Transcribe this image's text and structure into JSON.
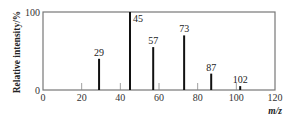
{
  "chart_data": {
    "type": "bar",
    "title": "",
    "xlabel": "m/z",
    "ylabel": "Relative intensity/%",
    "xlim": [
      0,
      120
    ],
    "ylim": [
      0,
      100
    ],
    "x_ticks": [
      0,
      20,
      40,
      60,
      80,
      100,
      120
    ],
    "y_ticks": [
      0,
      100
    ],
    "grid": false,
    "legend": null,
    "peaks": [
      {
        "mz": 29,
        "intensity": 40,
        "label": "29"
      },
      {
        "mz": 45,
        "intensity": 100,
        "label": "45"
      },
      {
        "mz": 57,
        "intensity": 55,
        "label": "57"
      },
      {
        "mz": 73,
        "intensity": 70,
        "label": "73"
      },
      {
        "mz": 87,
        "intensity": 21,
        "label": "87"
      },
      {
        "mz": 102,
        "intensity": 5,
        "label": "102"
      }
    ],
    "categories": [
      "29",
      "45",
      "57",
      "73",
      "87",
      "102"
    ],
    "values": [
      40,
      100,
      57,
      70,
      21,
      5
    ]
  },
  "labels": {
    "ylabel": "Relative intensity/%",
    "xlabel": "m/z",
    "y_top": "100",
    "y_bottom": "0"
  },
  "colors": {
    "frame": "#777777",
    "peak": "#111111",
    "tick": "#888888"
  }
}
